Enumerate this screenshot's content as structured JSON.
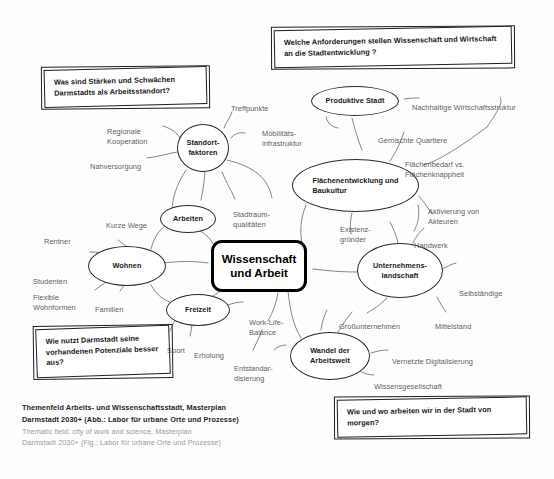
{
  "figure": {
    "title": "Themenfeld Arbeits- und Wissenschaftsstadt",
    "center": {
      "label": "Wissenschaft\nund Arbeit"
    },
    "caption": {
      "de_line1": "Themenfeld Arbeits- und Wissenschaftsstadt, Masterplan",
      "de_line2": "Darmstadt 2030+ (Abb.: Labor für urbane Orte und Prozesse)",
      "en_line1": "Thematic field: city of work and science, Masterplan",
      "en_line2": "Darmstadt 2030+ (Fig.: Labor für urbane Orte und Prozesse)"
    },
    "questions": [
      {
        "id": "q-staerken",
        "text": "Was sind Stärken und Schwächen Darmstadts als Arbeitsstandort?"
      },
      {
        "id": "q-anforderungen",
        "text": "Welche Anforderungen stellen Wissenschaft und Wirtschaft an die Stadtentwicklung ?"
      },
      {
        "id": "q-potenziale",
        "text": "Wie nutzt Darmstadt seine vorhandenen Potenziale besser aus?"
      },
      {
        "id": "q-morgen",
        "text": "Wie und wo arbeiten wir in der Stadt von morgen?"
      }
    ],
    "nodes": [
      {
        "id": "standortfaktoren",
        "label": "Standort-\nfaktoren"
      },
      {
        "id": "produktive-stadt",
        "label": "Produktive Stadt"
      },
      {
        "id": "flaechenentwicklung",
        "label": "Flächenentwicklung und\nBaukultur"
      },
      {
        "id": "arbeiten",
        "label": "Arbeiten"
      },
      {
        "id": "wohnen",
        "label": "Wohnen"
      },
      {
        "id": "freizeit",
        "label": "Freizeit"
      },
      {
        "id": "unternehmenslandschaft",
        "label": "Unternehmens-\nlandschaft"
      },
      {
        "id": "wandel-arbeitswelt",
        "label": "Wandel der\nArbeitswelt"
      }
    ],
    "leaves": [
      {
        "id": "treffpunkte",
        "label": "Treffpunkte"
      },
      {
        "id": "mobilitaetsinfrastruktur",
        "label": "Mobilitäts-\ninfrastruktur"
      },
      {
        "id": "regionale-kooperation",
        "label": "Regionale\nKooperation"
      },
      {
        "id": "nahversorgung",
        "label": "Nahversorgung"
      },
      {
        "id": "stadtraumqualitaeten",
        "label": "Stadtraum-\nqualitäten"
      },
      {
        "id": "nachhaltige-wirtschaftsstruktur",
        "label": "Nachhaltige Wirtschaftsstruktur"
      },
      {
        "id": "gemischte-quartiere",
        "label": "Gemischte Quartiere"
      },
      {
        "id": "flaechenbedarf",
        "label": "Flächenbedarf vs.\nFlächenknappheit"
      },
      {
        "id": "aktivierung-akteuren",
        "label": "Aktivierung von\nAkteuren"
      },
      {
        "id": "handwerk",
        "label": "Handwerk"
      },
      {
        "id": "existenzgruender",
        "label": "Existenz-\ngründer"
      },
      {
        "id": "kurze-wege",
        "label": "Kurze Wege"
      },
      {
        "id": "rentner",
        "label": "Rentner"
      },
      {
        "id": "studenten",
        "label": "Studenten"
      },
      {
        "id": "flexible-wohnformen",
        "label": "Flexible\nWohnformen"
      },
      {
        "id": "familien",
        "label": "Familien"
      },
      {
        "id": "sport",
        "label": "Sport"
      },
      {
        "id": "erholung",
        "label": "Erholung"
      },
      {
        "id": "work-life-balance",
        "label": "Work-Life-\nBalance"
      },
      {
        "id": "entstandardisierung",
        "label": "Entstandar-\ndisierung"
      },
      {
        "id": "selbstaendige",
        "label": "Selbständige"
      },
      {
        "id": "grossunternehmen",
        "label": "Großunternehmen"
      },
      {
        "id": "mittelstand",
        "label": "Mittelstand"
      },
      {
        "id": "vernetzte-digitalisierung",
        "label": "Vernetzte Digitalisierung"
      },
      {
        "id": "wissensgesellschaft",
        "label": "Wissensgesellschaft"
      }
    ],
    "colors": {
      "background": "#fdfdfd",
      "node_stroke": "#2b2b2b",
      "core_stroke": "#000000",
      "leaf_text": "#5d5d5d",
      "caption_de": "#1f1f1f",
      "caption_en": "#9b9b9b"
    }
  }
}
